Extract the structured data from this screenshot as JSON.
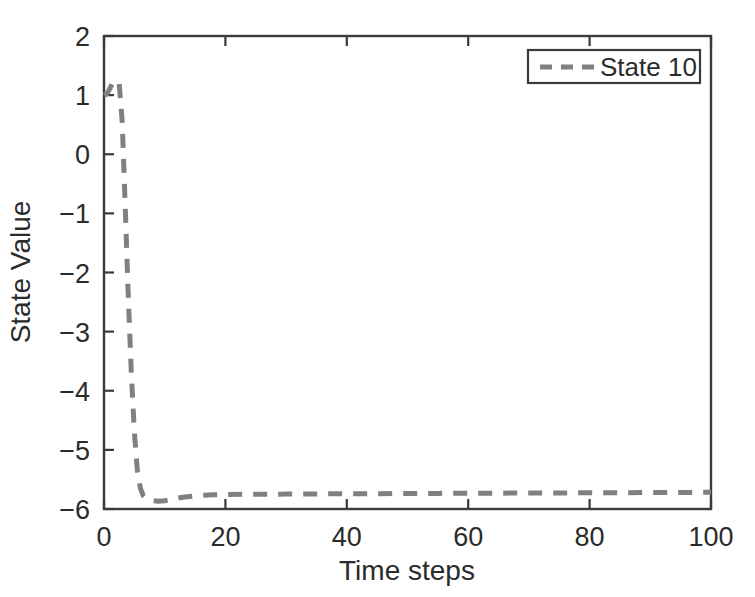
{
  "figure": {
    "background_color": "#ffffff",
    "axis_color": "#3a3a3a",
    "text_color": "#2b2b2b"
  },
  "chart_data": {
    "type": "line",
    "title": "",
    "xlabel": "Time steps",
    "ylabel": "State Value",
    "xlim": [
      0,
      100
    ],
    "ylim": [
      -6,
      2
    ],
    "xticks": [
      0,
      20,
      40,
      60,
      80,
      100
    ],
    "yticks": [
      2,
      1,
      0,
      -1,
      -2,
      -3,
      -4,
      -5,
      -6
    ],
    "xtick_labels": [
      "0",
      "20",
      "40",
      "60",
      "80",
      "100"
    ],
    "ytick_labels": [
      "2",
      "1",
      "0",
      "-1",
      "-2",
      "-3",
      "-4",
      "-5",
      "-6"
    ],
    "grid": false,
    "legend_position": "top-right",
    "legend_entries": [
      "State 10"
    ],
    "series": [
      {
        "name": "State 10",
        "color": "#808080",
        "linestyle": "dashed",
        "linewidth": 5,
        "dash_pattern": "14 11",
        "x": [
          0,
          0.5,
          1,
          1.5,
          2,
          2.5,
          3,
          3.5,
          4,
          4.5,
          5,
          5.5,
          6,
          6.5,
          7,
          8,
          9,
          10,
          11,
          12,
          13,
          14,
          15,
          16,
          18,
          20,
          25,
          30,
          35,
          40,
          45,
          50,
          55,
          60,
          65,
          70,
          75,
          80,
          85,
          90,
          95,
          100
        ],
        "y": [
          1.0,
          1.02,
          1.12,
          1.22,
          1.25,
          1.2,
          0.55,
          -0.9,
          -2.4,
          -3.7,
          -4.7,
          -5.35,
          -5.65,
          -5.78,
          -5.83,
          -5.86,
          -5.87,
          -5.86,
          -5.84,
          -5.82,
          -5.8,
          -5.79,
          -5.78,
          -5.77,
          -5.76,
          -5.755,
          -5.75,
          -5.748,
          -5.745,
          -5.743,
          -5.74,
          -5.738,
          -5.736,
          -5.734,
          -5.732,
          -5.73,
          -5.728,
          -5.726,
          -5.724,
          -5.722,
          -5.72,
          -5.718
        ]
      }
    ]
  },
  "legend": {
    "items": [
      {
        "label": "State 10",
        "color": "#808080"
      }
    ]
  },
  "axes": {
    "x_axis_title": "Time steps",
    "y_axis_title": "State Value"
  }
}
